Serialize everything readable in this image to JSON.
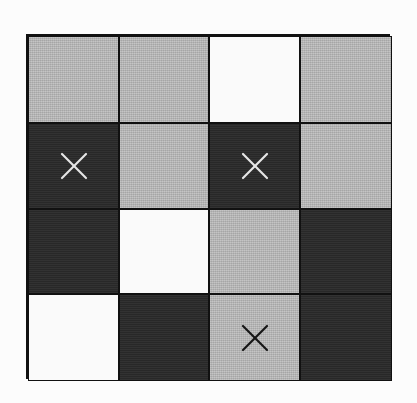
{
  "board": {
    "rows": 4,
    "cols": 4,
    "colors": {
      "gray": "#b9b9b9",
      "dark": "#2a2a2a",
      "white": "#fafafa",
      "grid_line": "#111111"
    },
    "cells": [
      [
        {
          "shade": "gray",
          "mark": ""
        },
        {
          "shade": "gray",
          "mark": ""
        },
        {
          "shade": "white",
          "mark": ""
        },
        {
          "shade": "gray",
          "mark": ""
        }
      ],
      [
        {
          "shade": "dark",
          "mark": "x"
        },
        {
          "shade": "gray",
          "mark": ""
        },
        {
          "shade": "dark",
          "mark": "x"
        },
        {
          "shade": "gray",
          "mark": ""
        }
      ],
      [
        {
          "shade": "dark",
          "mark": ""
        },
        {
          "shade": "white",
          "mark": ""
        },
        {
          "shade": "gray",
          "mark": ""
        },
        {
          "shade": "dark",
          "mark": ""
        }
      ],
      [
        {
          "shade": "white",
          "mark": ""
        },
        {
          "shade": "dark",
          "mark": ""
        },
        {
          "shade": "gray",
          "mark": "x"
        },
        {
          "shade": "dark",
          "mark": ""
        }
      ]
    ]
  },
  "icons": {
    "mark_x": "cross-mark-icon"
  }
}
